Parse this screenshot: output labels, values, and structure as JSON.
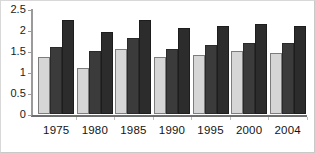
{
  "chart_data": {
    "type": "bar",
    "title": "",
    "subtitle": "",
    "xlabel": "",
    "ylabel": "",
    "categories": [
      "1975",
      "1980",
      "1985",
      "1990",
      "1995",
      "2000",
      "2004"
    ],
    "series": [
      {
        "name": "series-1",
        "color": "#d6d6d6",
        "values": [
          1.35,
          1.1,
          1.55,
          1.35,
          1.4,
          1.5,
          1.45
        ]
      },
      {
        "name": "series-2",
        "color": "#3b3b3b",
        "values": [
          1.6,
          1.5,
          1.8,
          1.55,
          1.65,
          1.7,
          1.7
        ]
      },
      {
        "name": "series-3",
        "color": "#2c2c2c",
        "values": [
          2.25,
          1.95,
          2.25,
          2.05,
          2.1,
          2.15,
          2.1
        ]
      }
    ],
    "ylim": [
      0,
      2.5
    ],
    "yticks": [
      0,
      0.5,
      1,
      1.5,
      2,
      2.5
    ],
    "ytick_labels": [
      "0",
      "0.5",
      "1",
      "1.5",
      "2",
      "2.5"
    ],
    "grid": false,
    "legend": "none",
    "annotations": []
  },
  "colors": {
    "background": "#ffffff",
    "axis": "#6e6e6e",
    "text": "#141414",
    "frame": "#c9c9c9"
  }
}
